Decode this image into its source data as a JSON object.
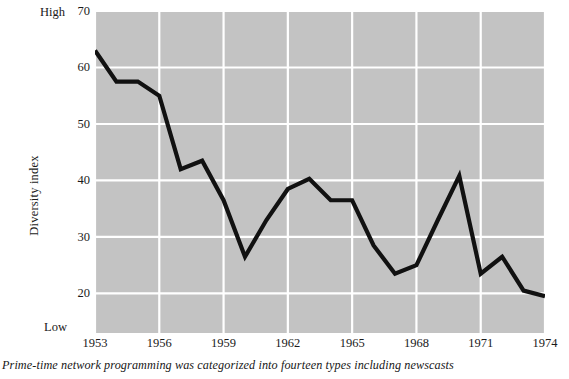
{
  "figure": {
    "caption": "Prime-time network programming was categorized into fourteen types including newscasts",
    "high_label": "High",
    "low_label": "Low"
  },
  "chart_data": {
    "type": "line",
    "title": "",
    "xlabel": "",
    "ylabel": "Diversity index",
    "xlim": [
      1953,
      1974
    ],
    "ylim": [
      13,
      70
    ],
    "grid": true,
    "legend": "none",
    "plot_background": "#c3c3c3",
    "gridline_color": "#ffffff",
    "line_color": "#111111",
    "axis_anchor_high": "High",
    "axis_anchor_low": "Low",
    "ytick_labels": [
      "70",
      "60",
      "50",
      "40",
      "30",
      "20"
    ],
    "ytick_values": [
      70,
      60,
      50,
      40,
      30,
      20
    ],
    "xtick_labels": [
      "1953",
      "1956",
      "1959",
      "1962",
      "1965",
      "1968",
      "1971",
      "1974"
    ],
    "xtick_values": [
      1953,
      1956,
      1959,
      1962,
      1965,
      1968,
      1971,
      1974
    ],
    "x": [
      1953,
      1954,
      1955,
      1956,
      1957,
      1958,
      1959,
      1960,
      1961,
      1962,
      1963,
      1964,
      1965,
      1966,
      1967,
      1968,
      1969,
      1970,
      1971,
      1972,
      1973,
      1974
    ],
    "values": [
      63,
      57.5,
      57.5,
      55,
      42,
      43.5,
      36.5,
      26.5,
      33,
      38.5,
      40.3,
      36.5,
      36.5,
      28.5,
      23.5,
      25,
      33,
      40.8,
      23.5,
      26.5,
      20.5,
      19.5
    ],
    "series": [
      {
        "name": "Diversity index",
        "values": [
          63,
          57.5,
          57.5,
          55,
          42,
          43.5,
          36.5,
          26.5,
          33,
          38.5,
          40.3,
          36.5,
          36.5,
          28.5,
          23.5,
          25,
          33,
          40.8,
          23.5,
          26.5,
          20.5,
          19.5
        ]
      }
    ]
  }
}
